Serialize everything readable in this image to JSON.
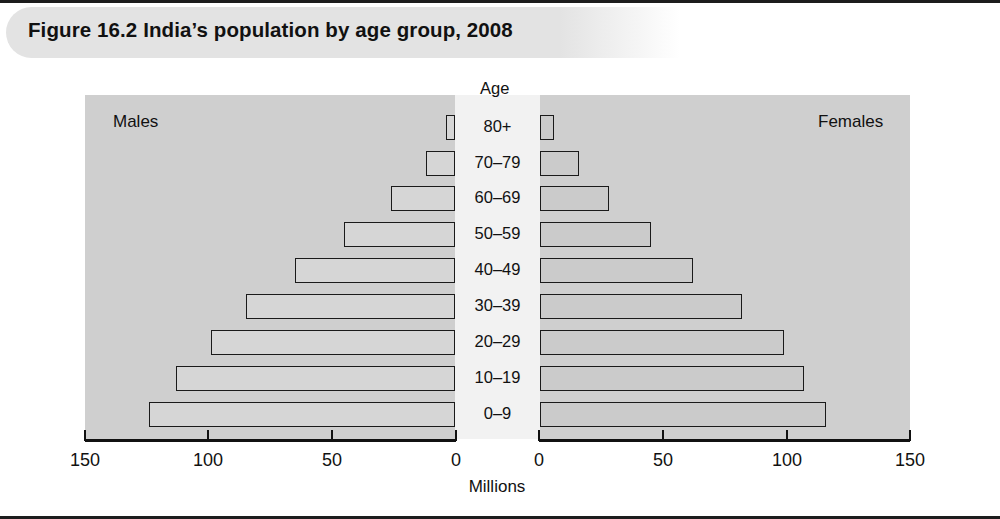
{
  "figure": {
    "title": "Figure 16.2  India’s population by age group, 2008",
    "age_header": "Age",
    "left_side_label": "Males",
    "right_side_label": "Females",
    "axis_title": "Millions",
    "colors": {
      "header_band": "#e3e3e3",
      "plot_background": "#cfcfcf",
      "gutter_background": "#f2f2f2",
      "bar_fill": "#d2d2d2",
      "bar_stroke": "#1a1a1a",
      "rule": "#1d1d1d"
    }
  },
  "chart_data": {
    "type": "bar",
    "subtype": "population-pyramid",
    "title": "Figure 16.2  India’s population by age group, 2008",
    "xlabel": "Millions",
    "ylabel": "Age",
    "categories": [
      "0–9",
      "10–19",
      "20–29",
      "30–39",
      "40–49",
      "50–59",
      "60–69",
      "70–79",
      "80+"
    ],
    "category_order_top_to_bottom": [
      "80+",
      "70–79",
      "60–69",
      "50–59",
      "40–49",
      "30–39",
      "20–29",
      "10–19",
      "0–9"
    ],
    "series": [
      {
        "name": "Males",
        "side": "left",
        "direction": "right-to-left",
        "values": [
          124,
          113,
          99,
          85,
          65,
          45,
          26,
          12,
          4
        ]
      },
      {
        "name": "Females",
        "side": "right",
        "direction": "left-to-right",
        "values": [
          116,
          107,
          99,
          82,
          62,
          45,
          28,
          16,
          6
        ]
      }
    ],
    "left_axis_ticks": [
      150,
      100,
      50,
      0
    ],
    "right_axis_ticks": [
      0,
      50,
      100,
      150
    ],
    "xlim": [
      0,
      150
    ],
    "grid": false,
    "legend": "inline side labels (Males left, Females right)"
  },
  "left_tick_labels": [
    {
      "value": "150",
      "x": 85
    },
    {
      "value": "100",
      "x": 208
    },
    {
      "value": "50",
      "x": 332
    },
    {
      "value": "0",
      "x": 456
    }
  ],
  "right_tick_labels": [
    {
      "value": "0",
      "x": 539
    },
    {
      "value": "50",
      "x": 663
    },
    {
      "value": "100",
      "x": 787
    },
    {
      "value": "150",
      "x": 910
    }
  ]
}
